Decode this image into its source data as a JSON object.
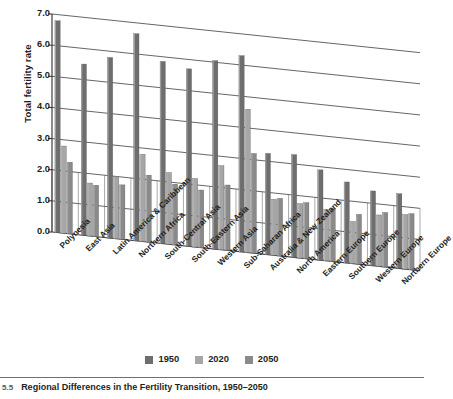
{
  "figure": {
    "caption_number": "5.5",
    "caption_text": "Regional Differences in the Fertility Transition, 1950–2050"
  },
  "legend": {
    "position": "bottom-center",
    "items": [
      {
        "label": "1950",
        "color": "#6e6e6e"
      },
      {
        "label": "2020",
        "color": "#a6a6a6"
      },
      {
        "label": "2050",
        "color": "#8a8a8a"
      }
    ]
  },
  "axis": {
    "ylabel": "Total fertility rate",
    "yticks": [
      "0.0",
      "1.0",
      "2.0",
      "3.0",
      "4.0",
      "5.0",
      "6.0",
      "7.0"
    ]
  },
  "chart_data": {
    "type": "bar",
    "title": "Regional Differences in the Fertility Transition, 1950–2050",
    "xlabel": "",
    "ylabel": "Total fertility rate",
    "ylim": [
      0,
      7
    ],
    "ytick_values": [
      0,
      1,
      2,
      3,
      4,
      5,
      6,
      7
    ],
    "grid": true,
    "legend_position": "bottom-center",
    "projection": "3d-perspective",
    "categories": [
      "Polynesia",
      "East Asia",
      "Latin America & Caribbean",
      "Northern Africa",
      "South-Central Asia",
      "South-Eastern Asia",
      "Western Asia",
      "Sub-Saharan Africa",
      "Australia & New Zealand",
      "North America",
      "Eastern Europe",
      "Southern Europe",
      "Western Europe",
      "Northern Europe"
    ],
    "series": [
      {
        "name": "1950",
        "color": "#6e6e6e",
        "values": [
          6.8,
          5.5,
          5.8,
          6.65,
          5.85,
          5.7,
          6.05,
          6.3,
          3.25,
          3.3,
          2.9,
          2.6,
          2.4,
          2.4
        ]
      },
      {
        "name": "2020",
        "color": "#a6a6a6",
        "values": [
          2.8,
          1.7,
          2.0,
          2.8,
          2.3,
          2.2,
          2.7,
          4.6,
          1.8,
          1.75,
          1.65,
          1.35,
          1.65,
          1.75
        ]
      },
      {
        "name": "2050",
        "color": "#8a8a8a",
        "values": [
          2.3,
          1.65,
          1.75,
          2.15,
          1.95,
          1.85,
          2.1,
          3.2,
          1.85,
          1.8,
          1.7,
          1.6,
          1.75,
          1.8
        ]
      }
    ]
  }
}
